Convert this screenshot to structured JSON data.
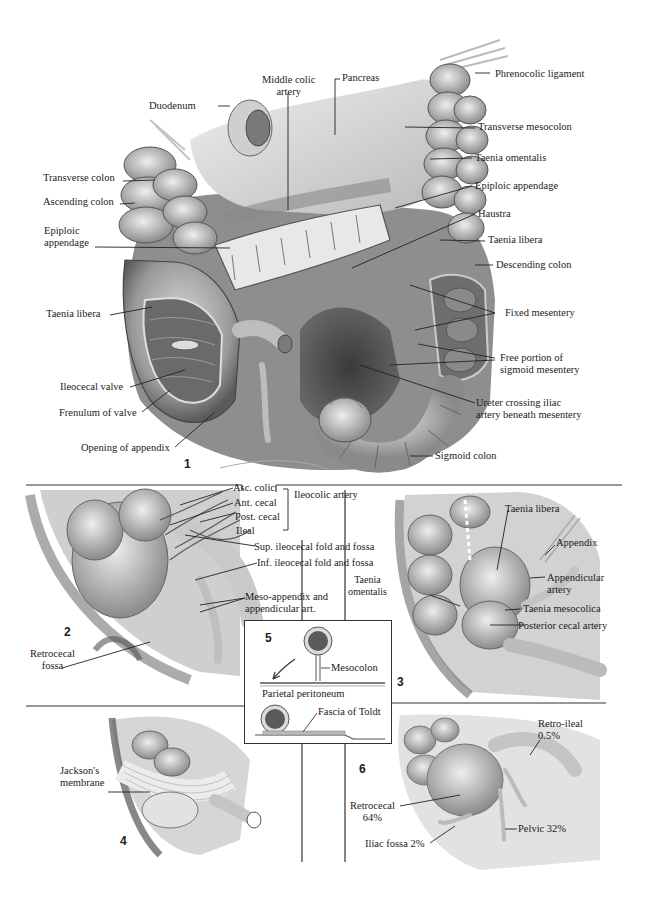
{
  "figure": {
    "panels": [
      {
        "id": "1",
        "number": "1"
      },
      {
        "id": "2",
        "number": "2"
      },
      {
        "id": "3",
        "number": "3"
      },
      {
        "id": "4",
        "number": "4"
      },
      {
        "id": "5",
        "number": "5"
      },
      {
        "id": "6",
        "number": "6"
      }
    ]
  },
  "panel1": {
    "middle_colic_artery": [
      "Middle colic",
      "artery"
    ],
    "pancreas": "Pancreas",
    "phrenocolic_ligament": "Phrenocolic ligament",
    "duodenum": "Duodenum",
    "transverse_mesocolon": "Transverse mesocolon",
    "taenia_omentalis": "Taenia omentalis",
    "transverse_colon": "Transverse colon",
    "ascending_colon": "Ascending colon",
    "epiploic_appendage_right": "Epiploic appendage",
    "epiploic_appendage_left": [
      "Epiploic",
      "appendage"
    ],
    "haustra": "Haustra",
    "taenia_libera_right": "Taenia libera",
    "descending_colon": "Descending colon",
    "taenia_libera_left": "Taenia libera",
    "fixed_mesentery": "Fixed mesentery",
    "free_portion": [
      "Free portion of",
      "sigmoid mesentery"
    ],
    "ileocecal_valve": "Ileocecal valve",
    "frenulum": "Frenulum of valve",
    "ureter": [
      "Ureter crossing iliac",
      "artery beneath mesentery"
    ],
    "opening_appendix": "Opening of appendix",
    "sigmoid_colon": "Sigmoid colon"
  },
  "panel2": {
    "asc_colic": "Asc. colic",
    "ant_cecal": "Ant. cecal",
    "post_cecal": "Post. cecal",
    "ileal": "Ileal",
    "ileocolic_artery": "Ileocolic artery",
    "sup_fold": "Sup. ileocecal fold and fossa",
    "inf_fold": "Inf. ileocecal fold and fossa",
    "meso_appendix": [
      "Meso-appendix and",
      "appendicular art."
    ],
    "retrocecal_fossa": [
      "Retrocecal",
      "fossa"
    ]
  },
  "panel3": {
    "taenia_libera": "Taenia libera",
    "appendix": "Appendix",
    "appendicular_artery": [
      "Appendicular",
      "artery"
    ],
    "taenia_omentalis": [
      "Taenia",
      "omentalis"
    ],
    "taenia_mesocolica": "Taenia mesocolica",
    "posterior_cecal_artery": "Posterior cecal artery"
  },
  "panel5": {
    "mesocolon": "Mesocolon",
    "parietal_peritoneum": "Parietal peritoneum",
    "fascia_of_toldt": "Fascia of Toldt"
  },
  "panel4": {
    "jacksons_membrane": [
      "Jackson's",
      "membrane"
    ]
  },
  "panel6": {
    "retro_ileal": [
      "Retro-ileal",
      "0.5%"
    ],
    "retrocecal": [
      "Retrocecal",
      "64%"
    ],
    "pelvic": "Pelvic 32%",
    "iliac_fossa": "Iliac fossa 2%"
  },
  "colors": {
    "ink": "#1b1b1b",
    "tissue_dark": "#4a4a4a",
    "tissue_mid": "#8c8c8c",
    "tissue_light": "#c8c8c8",
    "tissue_pale": "#e4e4e4"
  }
}
